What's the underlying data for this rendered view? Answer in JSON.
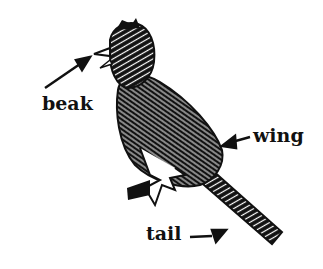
{
  "diagram": {
    "labels": [
      {
        "id": "beak",
        "text": "beak"
      },
      {
        "id": "wing",
        "text": "wing"
      },
      {
        "id": "tail",
        "text": "tail"
      }
    ],
    "colors": {
      "ink": "#111111",
      "background": "#ffffff"
    }
  }
}
